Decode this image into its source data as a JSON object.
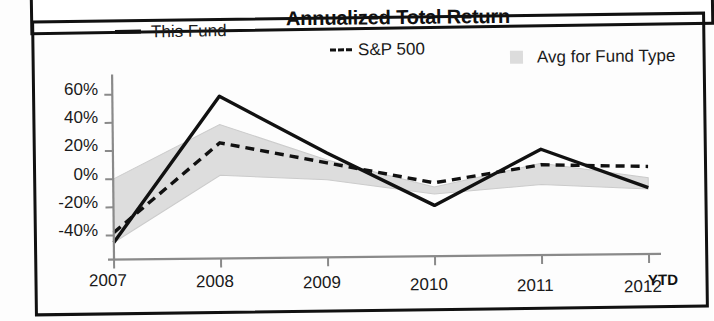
{
  "chart_data": {
    "type": "line",
    "title": "Annualized Total Return",
    "xlabel": "",
    "ylabel": "",
    "categories": [
      "2007",
      "2008",
      "2009",
      "2010",
      "2011",
      "2012"
    ],
    "x_axis_note": "YTD",
    "ylim": [
      -50,
      70
    ],
    "ytick_labels": [
      "60%",
      "40%",
      "20%",
      "0%",
      "-20%",
      "-40%"
    ],
    "ytick_values": [
      60,
      40,
      20,
      0,
      -20,
      -40
    ],
    "grid": false,
    "legend_position": "top",
    "series": [
      {
        "name": "This Fund",
        "style": "solid",
        "color": "#111111",
        "values": [
          -45,
          58,
          17,
          -21,
          18,
          -10
        ]
      },
      {
        "name": "S&P 500",
        "style": "dashed",
        "color": "#111111",
        "values": [
          -38,
          25,
          10,
          -5,
          7,
          5
        ]
      },
      {
        "name": "Avg for Fund Type",
        "style": "band",
        "color": "#dcdcdc",
        "band_upper": [
          0,
          38,
          12,
          -8,
          8,
          -3
        ],
        "band_lower": [
          -45,
          2,
          -2,
          -13,
          -7,
          -11
        ]
      }
    ]
  },
  "legend": {
    "fund_label": "This Fund",
    "sp_label": "S&P 500",
    "avg_label": "Avg for Fund Type"
  },
  "axis": {
    "y_ticks": [
      "60%",
      "40%",
      "20%",
      "0%",
      "-20%",
      "-40%"
    ],
    "x_ticks": [
      "2007",
      "2008",
      "2009",
      "2010",
      "2011",
      "2012"
    ],
    "ytd_label": "YTD"
  },
  "colors": {
    "line": "#111111",
    "band": "#dcdcdc",
    "axis": "#8a8a8a",
    "frame": "#111111"
  }
}
